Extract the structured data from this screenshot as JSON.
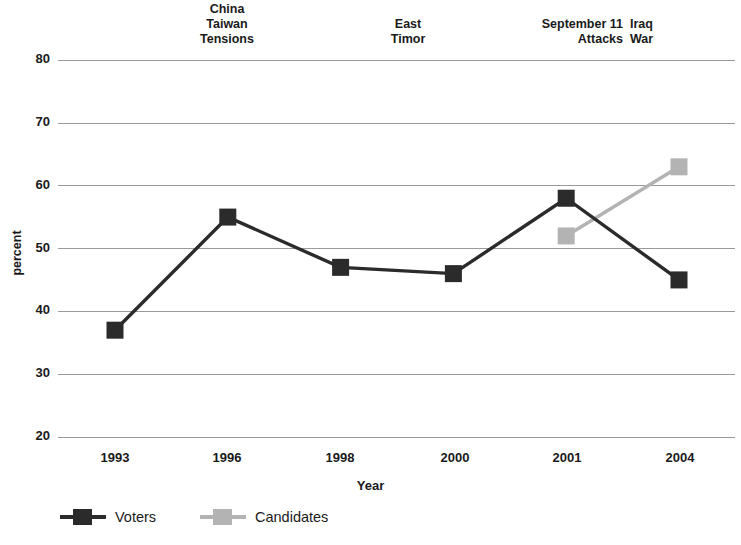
{
  "chart_data": {
    "type": "line",
    "title": "",
    "xlabel": "Year",
    "ylabel": "percent",
    "categories": [
      "1993",
      "1996",
      "1998",
      "2000",
      "2001",
      "2004"
    ],
    "ylim": [
      20,
      80
    ],
    "yticks": [
      20,
      30,
      40,
      50,
      60,
      70,
      80
    ],
    "grid": true,
    "legend_position": "bottom-left",
    "series": [
      {
        "name": "Voters",
        "color": "#2b2b2b",
        "marker": "square",
        "x": [
          "1993",
          "1996",
          "1998",
          "2000",
          "2001",
          "2004"
        ],
        "values": [
          37,
          55,
          47,
          46,
          58,
          45
        ]
      },
      {
        "name": "Candidates",
        "color": "#b3b3b3",
        "marker": "square",
        "x": [
          "2001",
          "2004"
        ],
        "values": [
          52,
          63
        ]
      }
    ],
    "annotations": [
      {
        "id": "china-taiwan-tensions",
        "text": "China\nTaiwan\nTensions",
        "near_category": "1996"
      },
      {
        "id": "east-timor",
        "text": "East\nTimor",
        "near_category": "1998"
      },
      {
        "id": "september-11-attacks",
        "text": "September 11\nAttacks",
        "near_category": "2001"
      },
      {
        "id": "iraq-war",
        "text": "Iraq\nWar",
        "near_category": "2004"
      }
    ]
  },
  "axes": {
    "y_title": "percent",
    "x_title": "Year",
    "y_tick_labels": [
      "80",
      "70",
      "60",
      "50",
      "40",
      "30",
      "20"
    ],
    "x_tick_labels": [
      "1993",
      "1996",
      "1998",
      "2000",
      "2001",
      "2004"
    ]
  },
  "legend": {
    "items": [
      {
        "label": "Voters",
        "color": "#2b2b2b"
      },
      {
        "label": "Candidates",
        "color": "#b3b3b3"
      }
    ]
  },
  "annotations": {
    "china_taiwan_tensions": "China\nTaiwan\nTensions",
    "east_timor": "East\nTimor",
    "september_11_attacks": "September 11\nAttacks",
    "iraq_war": "Iraq\nWar"
  },
  "colors": {
    "voters": "#2b2b2b",
    "candidates": "#b3b3b3",
    "gridline": "#9a9a9a",
    "text": "#1a1a1a",
    "background": "#ffffff"
  }
}
